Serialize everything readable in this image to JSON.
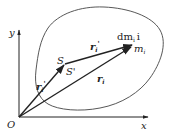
{
  "diagram": {
    "type": "vector-diagram",
    "axes": {
      "x_label": "x",
      "y_label": "y",
      "origin_label": "O"
    },
    "points": {
      "s_label": "S",
      "s_prime_label": "S'",
      "mass_element_label": "dm",
      "mass_element_sub": "i",
      "mass_element_index": "i",
      "mass_label": "m",
      "mass_sub": "i"
    },
    "vectors": [
      {
        "id": "origin-to-s",
        "label": "r",
        "sub": "i",
        "prime": "'"
      },
      {
        "id": "s-to-mass",
        "label": "r",
        "sub": "i",
        "prime": "'"
      },
      {
        "id": "origin-to-mass",
        "label": "r",
        "sub": "i",
        "prime": ""
      }
    ],
    "colors": {
      "line": "#222222",
      "body_outline": "#444444",
      "background": "#ffffff"
    }
  }
}
